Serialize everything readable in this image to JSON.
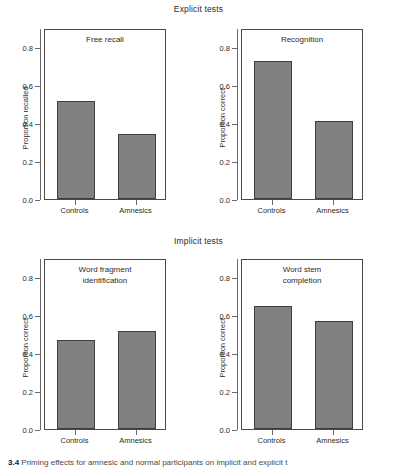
{
  "figure": {
    "caption_number": "3.4",
    "caption_text": "Priming effects for amnesic and normal participants on implicit and explicit t"
  },
  "chart_data": {
    "type": "bar",
    "categories": [
      "Controls",
      "Amnesics"
    ],
    "ylim": [
      0.0,
      0.9
    ],
    "yticks": [
      0.0,
      0.2,
      0.4,
      0.6,
      0.8
    ],
    "ytick_labels": [
      "0.0",
      "0.2",
      "0.4",
      "0.6",
      "0.8"
    ],
    "grid": false,
    "legend": "none",
    "bar_color": "#808080",
    "bar_edge_color": "#3f3f3f",
    "groups": [
      {
        "name": "Explicit tests",
        "panels": [
          {
            "id": "free-recall",
            "label_lines": [
              "Free recall"
            ],
            "ylabel": "Proportion recalled",
            "values": [
              0.515,
              0.34
            ]
          },
          {
            "id": "recognition",
            "label_lines": [
              "Recognition"
            ],
            "ylabel": "Proportion correct",
            "values": [
              0.725,
              0.41
            ]
          }
        ]
      },
      {
        "name": "Implicit tests",
        "panels": [
          {
            "id": "word-fragment",
            "label_lines": [
              "Word fragment",
              "identification"
            ],
            "ylabel": "Proportion correct",
            "values": [
              0.47,
              0.515
            ]
          },
          {
            "id": "word-stem",
            "label_lines": [
              "Word stem",
              "completion"
            ],
            "ylabel": "Proportion correct",
            "values": [
              0.645,
              0.57
            ]
          }
        ]
      }
    ]
  }
}
